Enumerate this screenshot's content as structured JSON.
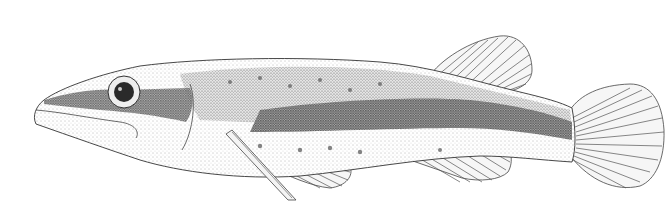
{
  "image": {
    "subject": "fish illustration",
    "style": "stippled pen-and-ink scientific drawing",
    "orientation": "facing left",
    "colors": {
      "background": "#ffffff",
      "ink": "#2a2a2a",
      "dark_band": "#555555",
      "mid_tone": "#9a9a9a",
      "light_tone": "#dcdcdc"
    }
  }
}
